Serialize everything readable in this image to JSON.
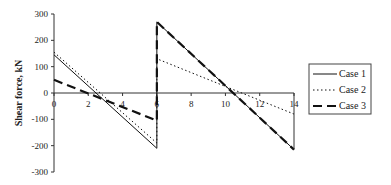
{
  "chart_data": {
    "type": "line",
    "title": "",
    "xlabel": "",
    "ylabel": "Shear force, kN",
    "xlim": [
      0,
      14
    ],
    "ylim": [
      -300,
      300
    ],
    "x_ticks": [
      "0",
      "2",
      "4",
      "6",
      "8",
      "10",
      "12",
      "14"
    ],
    "y_ticks": [
      "300",
      "200",
      "100",
      "0",
      "-100",
      "-200",
      "-300"
    ],
    "grid": false,
    "legend_position": "right",
    "series": [
      {
        "name": "Case 1",
        "style": "solid",
        "points": [
          [
            0,
            145
          ],
          [
            6,
            -210
          ],
          [
            6,
            270
          ],
          [
            14,
            -215
          ]
        ]
      },
      {
        "name": "Case 2",
        "style": "dotted",
        "points": [
          [
            0,
            155
          ],
          [
            6,
            -190
          ],
          [
            6,
            130
          ],
          [
            14,
            -80
          ]
        ]
      },
      {
        "name": "Case 3",
        "style": "dashed",
        "points": [
          [
            0,
            50
          ],
          [
            6,
            -105
          ],
          [
            6,
            270
          ],
          [
            14,
            -215
          ]
        ]
      }
    ]
  }
}
